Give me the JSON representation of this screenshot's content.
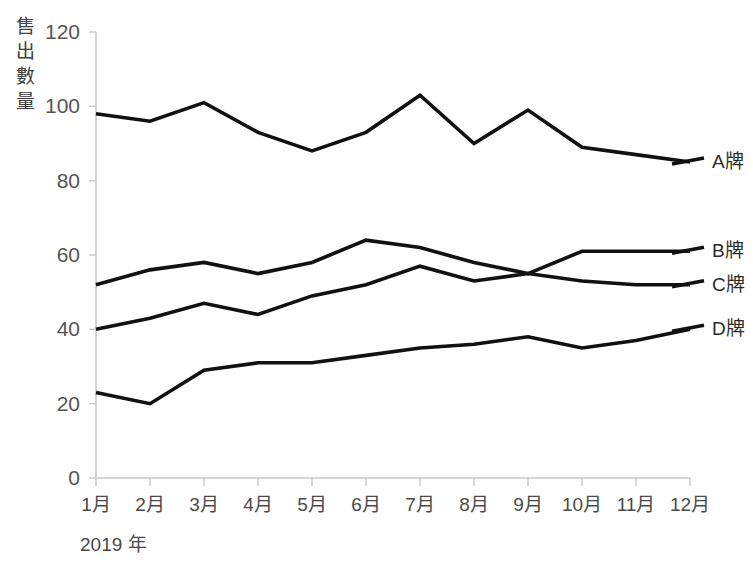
{
  "chart_data": {
    "type": "line",
    "title": "",
    "xlabel": "2019 年",
    "ylabel": "售出數量",
    "categories": [
      "1月",
      "2月",
      "3月",
      "4月",
      "5月",
      "6月",
      "7月",
      "8月",
      "9月",
      "10月",
      "11月",
      "12月"
    ],
    "yticks": [
      0,
      20,
      40,
      60,
      80,
      100,
      120
    ],
    "ylim": [
      0,
      120
    ],
    "grid": false,
    "legend_position": "right",
    "series": [
      {
        "name": "A牌",
        "color": "#111111",
        "values": [
          98,
          96,
          101,
          93,
          88,
          93,
          103,
          90,
          99,
          89,
          87,
          85
        ]
      },
      {
        "name": "B牌",
        "color": "#111111",
        "values": [
          52,
          56,
          58,
          55,
          58,
          64,
          62,
          58,
          55,
          61,
          61,
          61
        ]
      },
      {
        "name": "C牌",
        "color": "#111111",
        "values": [
          40,
          43,
          47,
          44,
          49,
          52,
          57,
          53,
          55,
          53,
          52,
          52
        ]
      },
      {
        "name": "D牌",
        "color": "#111111",
        "values": [
          23,
          20,
          29,
          31,
          31,
          33,
          35,
          36,
          38,
          35,
          37,
          40
        ]
      }
    ]
  },
  "axis": {
    "ylabel_chars": [
      "售",
      "出",
      "數",
      "量"
    ],
    "year_label": "2019 年"
  },
  "legend": {
    "items": [
      {
        "label": "A牌"
      },
      {
        "label": "B牌"
      },
      {
        "label": "C牌"
      },
      {
        "label": "D牌"
      }
    ]
  },
  "colors": {
    "line": "#111111",
    "axis": "#c8c8c8",
    "text": "#4a4a4a",
    "background": "#ffffff"
  }
}
